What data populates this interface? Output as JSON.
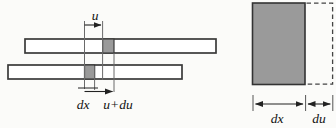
{
  "colors": {
    "paper": "#fbfbf9",
    "bar_outline": "#3a3a3a",
    "bar_fill": "#ffffff",
    "element_fill": "#9a9a9a",
    "thin_line": "#6a6a6a",
    "arrow": "#222222",
    "label": "#111111"
  },
  "left_diagram": {
    "labels": {
      "u": "u",
      "dx": "dx",
      "u_plus_du": "u+du"
    }
  },
  "right_diagram": {
    "labels": {
      "dx": "dx",
      "du": "du"
    }
  }
}
